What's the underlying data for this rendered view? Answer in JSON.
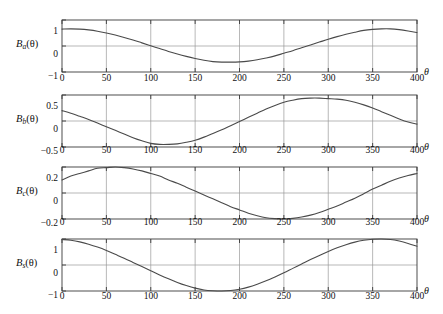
{
  "chart_data": [
    {
      "type": "line",
      "name": "panel-a",
      "ylabel": "B_a(θ)",
      "ylabel_base": "B",
      "ylabel_sub": "a",
      "ylabel_arg": "(θ)",
      "xlabel": "θ",
      "xlim": [
        0,
        400
      ],
      "ylim": [
        -1,
        1
      ],
      "xticks": [
        0,
        50,
        100,
        150,
        200,
        250,
        300,
        350,
        400
      ],
      "xticklabels": [
        "0",
        "50",
        "100",
        "150",
        "200",
        "250",
        "300",
        "350",
        "400"
      ],
      "yticks": [
        -1,
        0,
        1
      ],
      "yticklabels": [
        "−1",
        "0",
        "1"
      ],
      "grid": true,
      "legend": "none",
      "x": [
        0,
        10,
        20,
        30,
        40,
        50,
        60,
        70,
        80,
        90,
        100,
        110,
        120,
        130,
        140,
        150,
        160,
        170,
        180,
        190,
        200,
        210,
        220,
        230,
        240,
        250,
        260,
        270,
        280,
        290,
        300,
        310,
        320,
        330,
        340,
        350,
        360,
        370,
        380,
        390,
        400
      ],
      "values": [
        0.65,
        0.66,
        0.65,
        0.62,
        0.57,
        0.5,
        0.42,
        0.33,
        0.23,
        0.12,
        0.01,
        -0.1,
        -0.21,
        -0.31,
        -0.4,
        -0.48,
        -0.55,
        -0.6,
        -0.62,
        -0.62,
        -0.61,
        -0.58,
        -0.53,
        -0.46,
        -0.38,
        -0.28,
        -0.18,
        -0.07,
        0.04,
        0.15,
        0.26,
        0.36,
        0.45,
        0.53,
        0.6,
        0.64,
        0.66,
        0.66,
        0.63,
        0.58,
        0.52
      ]
    },
    {
      "type": "line",
      "name": "panel-b",
      "ylabel": "B_b(θ)",
      "ylabel_base": "B",
      "ylabel_sub": "b",
      "ylabel_arg": "(θ)",
      "xlabel": "θ",
      "xlim": [
        0,
        400
      ],
      "ylim": [
        -0.5,
        0.5
      ],
      "xticks": [
        0,
        50,
        100,
        150,
        200,
        250,
        300,
        350,
        400
      ],
      "xticklabels": [
        "0",
        "50",
        "100",
        "150",
        "200",
        "250",
        "300",
        "350",
        "400"
      ],
      "yticks": [
        -0.5,
        0,
        0.5
      ],
      "yticklabels": [
        "−0.5",
        "0",
        "0.5"
      ],
      "grid": true,
      "legend": "none",
      "x": [
        0,
        10,
        20,
        30,
        40,
        50,
        60,
        70,
        80,
        90,
        100,
        110,
        120,
        130,
        140,
        150,
        160,
        170,
        180,
        190,
        200,
        210,
        220,
        230,
        240,
        250,
        260,
        270,
        280,
        290,
        300,
        310,
        320,
        330,
        340,
        350,
        360,
        370,
        380,
        390,
        400
      ],
      "values": [
        0.2,
        0.15,
        0.09,
        0.03,
        -0.04,
        -0.11,
        -0.18,
        -0.25,
        -0.32,
        -0.38,
        -0.43,
        -0.45,
        -0.45,
        -0.44,
        -0.41,
        -0.37,
        -0.31,
        -0.24,
        -0.17,
        -0.09,
        -0.01,
        0.07,
        0.15,
        0.23,
        0.3,
        0.36,
        0.4,
        0.43,
        0.44,
        0.44,
        0.43,
        0.42,
        0.4,
        0.36,
        0.31,
        0.25,
        0.18,
        0.11,
        0.04,
        -0.02,
        -0.06
      ]
    },
    {
      "type": "line",
      "name": "panel-c",
      "ylabel": "B_c(θ)",
      "ylabel_base": "B",
      "ylabel_sub": "c",
      "ylabel_arg": "(θ)",
      "xlabel": "θ",
      "xlim": [
        0,
        400
      ],
      "ylim": [
        -0.2,
        0.2
      ],
      "xticks": [
        0,
        50,
        100,
        150,
        200,
        250,
        300,
        350,
        400
      ],
      "xticklabels": [
        "0",
        "50",
        "100",
        "150",
        "200",
        "250",
        "300",
        "350",
        "400"
      ],
      "yticks": [
        -0.2,
        0,
        0.2
      ],
      "yticklabels": [
        "−0.2",
        "0",
        "0.2"
      ],
      "grid": true,
      "legend": "none",
      "x": [
        0,
        10,
        20,
        30,
        40,
        50,
        60,
        70,
        80,
        90,
        100,
        110,
        120,
        130,
        140,
        150,
        160,
        170,
        180,
        190,
        200,
        210,
        220,
        230,
        240,
        250,
        260,
        270,
        280,
        290,
        300,
        310,
        320,
        330,
        340,
        350,
        360,
        370,
        380,
        390,
        400
      ],
      "values": [
        0.1,
        0.13,
        0.15,
        0.17,
        0.19,
        0.195,
        0.2,
        0.195,
        0.185,
        0.17,
        0.15,
        0.13,
        0.1,
        0.075,
        0.045,
        0.015,
        -0.015,
        -0.045,
        -0.075,
        -0.105,
        -0.13,
        -0.155,
        -0.175,
        -0.19,
        -0.197,
        -0.2,
        -0.195,
        -0.185,
        -0.17,
        -0.15,
        -0.125,
        -0.1,
        -0.07,
        -0.04,
        -0.005,
        0.03,
        0.06,
        0.09,
        0.115,
        0.135,
        0.15
      ]
    },
    {
      "type": "line",
      "name": "panel-s",
      "ylabel": "B_s(θ)",
      "ylabel_base": "B",
      "ylabel_sub": "s",
      "ylabel_arg": "(θ)",
      "xlabel": "θ",
      "xlim": [
        0,
        400
      ],
      "ylim": [
        -1,
        1
      ],
      "xticks": [
        0,
        50,
        100,
        150,
        200,
        250,
        300,
        350,
        400
      ],
      "xticklabels": [
        "0",
        "50",
        "100",
        "150",
        "200",
        "250",
        "300",
        "350",
        "400"
      ],
      "yticks": [
        -1,
        0,
        1
      ],
      "yticklabels": [
        "−1",
        "0",
        "1"
      ],
      "grid": true,
      "legend": "none",
      "x": [
        0,
        10,
        20,
        30,
        40,
        50,
        60,
        70,
        80,
        90,
        100,
        110,
        120,
        130,
        140,
        150,
        160,
        170,
        180,
        190,
        200,
        210,
        220,
        230,
        240,
        250,
        260,
        270,
        280,
        290,
        300,
        310,
        320,
        330,
        340,
        350,
        360,
        370,
        380,
        390,
        400
      ],
      "values": [
        0.98,
        0.95,
        0.89,
        0.8,
        0.69,
        0.56,
        0.41,
        0.26,
        0.1,
        -0.06,
        -0.22,
        -0.38,
        -0.53,
        -0.67,
        -0.79,
        -0.89,
        -0.96,
        -0.99,
        -1.0,
        -0.98,
        -0.93,
        -0.85,
        -0.74,
        -0.61,
        -0.46,
        -0.3,
        -0.13,
        0.04,
        0.21,
        0.37,
        0.52,
        0.66,
        0.78,
        0.88,
        0.95,
        0.99,
        1.0,
        0.98,
        0.92,
        0.83,
        0.72
      ]
    }
  ],
  "panels": [
    {
      "label_base": "B",
      "label_sub": "a",
      "label_arg": "(θ)",
      "yticklabels": [
        "1",
        "0",
        "−1"
      ],
      "xlabel": "θ"
    },
    {
      "label_base": "B",
      "label_sub": "b",
      "label_arg": "(θ)",
      "yticklabels": [
        "0.5",
        "0",
        "−0.5"
      ],
      "xlabel": "θ"
    },
    {
      "label_base": "B",
      "label_sub": "c",
      "label_arg": "(θ)",
      "yticklabels": [
        "0.2",
        "0",
        "−0.2"
      ],
      "xlabel": "θ"
    },
    {
      "label_base": "B",
      "label_sub": "s",
      "label_arg": "(θ)",
      "yticklabels": [
        "1",
        "0",
        "−1"
      ],
      "xlabel": "θ"
    }
  ],
  "xticklabels": [
    "0",
    "50",
    "100",
    "150",
    "200",
    "250",
    "300",
    "350",
    "400"
  ],
  "style": {
    "background": "#ffffff",
    "axis_color": "#3a3a3a",
    "grid_color": "#9a9a9a",
    "curve_color": "#4a4a4a",
    "text_color": "#111111"
  }
}
